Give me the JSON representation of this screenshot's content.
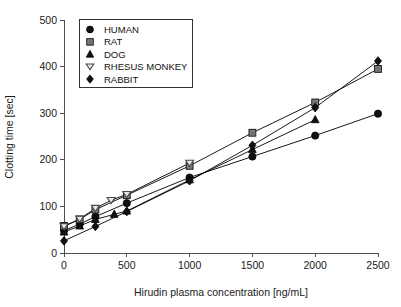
{
  "chart_data": {
    "type": "line",
    "title": "",
    "xlabel": "Hirudin plasma concentration [ng/mL]",
    "ylabel": "Clotting time [sec]",
    "xlim": [
      0,
      2500
    ],
    "ylim": [
      0,
      500
    ],
    "xticks": [
      0,
      500,
      1000,
      1500,
      2000,
      2500
    ],
    "yticks": [
      0,
      100,
      200,
      300,
      400,
      500
    ],
    "xtick_labels": [
      "0",
      "500",
      "1000",
      "1500",
      "2000",
      "2500"
    ],
    "ytick_labels": [
      "0",
      "100",
      "200",
      "300",
      "400",
      "500"
    ],
    "grid": false,
    "legend_position": "top-left",
    "series": [
      {
        "name": "HUMAN",
        "marker": "filled-circle",
        "color": "#111111",
        "x": [
          0,
          125,
          250,
          500,
          1000,
          1500,
          2000,
          2500
        ],
        "y": [
          48,
          62,
          78,
          107,
          162,
          207,
          252,
          299
        ]
      },
      {
        "name": "RAT",
        "marker": "filled-square",
        "color": "#808080",
        "x": [
          0,
          125,
          250,
          500,
          1000,
          1500,
          2000,
          2500
        ],
        "y": [
          58,
          72,
          93,
          124,
          187,
          258,
          323,
          395
        ]
      },
      {
        "name": "DOG",
        "marker": "filled-triangle-up",
        "color": "#111111",
        "x": [
          0,
          125,
          250,
          400,
          500,
          1000,
          1500,
          2000
        ],
        "y": [
          45,
          58,
          72,
          83,
          90,
          157,
          222,
          286
        ]
      },
      {
        "name": "RHESUS MONKEY",
        "marker": "open-triangle-down",
        "color": "#9a9a9a",
        "x": [
          0,
          125,
          250,
          375,
          500,
          1000
        ],
        "y": [
          57,
          73,
          96,
          113,
          126,
          193
        ]
      },
      {
        "name": "RABBIT",
        "marker": "filled-diamond",
        "color": "#111111",
        "x": [
          0,
          250,
          500,
          1000,
          1500,
          2000,
          2500
        ],
        "y": [
          26,
          57,
          89,
          155,
          231,
          312,
          412
        ]
      }
    ]
  },
  "legend": {
    "entries": [
      {
        "label": "HUMAN",
        "marker": "filled-circle"
      },
      {
        "label": "RAT",
        "marker": "filled-square"
      },
      {
        "label": "DOG",
        "marker": "filled-triangle-up"
      },
      {
        "label": "RHESUS MONKEY",
        "marker": "open-triangle-down"
      },
      {
        "label": "RABBIT",
        "marker": "filled-diamond"
      }
    ]
  },
  "colors": {
    "axis": "#4d4d4d",
    "text": "#1a1a1a",
    "line": "#000000",
    "marker_gray": "#808080",
    "marker_black": "#111111",
    "background": "#ffffff"
  }
}
